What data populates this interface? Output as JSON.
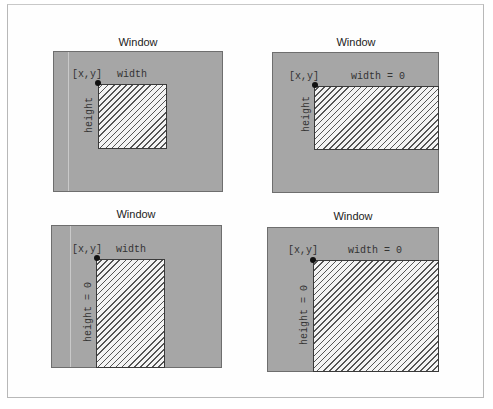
{
  "diagram": {
    "panels": [
      {
        "title": "Window",
        "origin_label": "[x,y]",
        "width_label": "width",
        "height_label": "height"
      },
      {
        "title": "Window",
        "origin_label": "[x,y]",
        "width_label": "width = 0",
        "height_label": "height"
      },
      {
        "title": "Window",
        "origin_label": "[x,y]",
        "width_label": "width",
        "height_label": "height = 0"
      },
      {
        "title": "Window",
        "origin_label": "[x,y]",
        "width_label": "width = 0",
        "height_label": "height = 0"
      }
    ],
    "colors": {
      "window_fill": "#a6a6a6",
      "region_fill": "#f4f4f4",
      "hatch": "#555555",
      "origin_dot": "#111111"
    }
  }
}
